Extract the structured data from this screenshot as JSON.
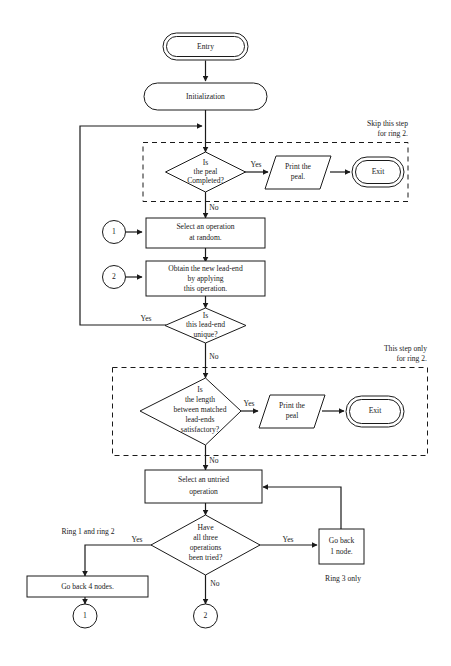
{
  "diagram": {
    "colors": {
      "stroke": "#1a1a1a",
      "background": "#ffffff"
    },
    "nodes": {
      "entry": {
        "label": "Entry",
        "type": "terminator"
      },
      "initialization": {
        "label": "Initialization",
        "type": "stadium"
      },
      "decision_peal_complete": {
        "line1": "Is",
        "line2": "the peal",
        "line3": "Completed?",
        "type": "decision"
      },
      "print_peal_1": {
        "line1": "Print the",
        "line2": "peal.",
        "type": "io"
      },
      "exit_1": {
        "label": "Exit",
        "type": "terminator"
      },
      "select_operation_random": {
        "line1": "Select an operation",
        "line2": "at random.",
        "type": "process"
      },
      "obtain_lead_end": {
        "line1": "Obtain the new lead-end",
        "line2": "by applying",
        "line3": "this operation.",
        "type": "process"
      },
      "decision_lead_end_unique": {
        "line1": "Is",
        "line2": "this lead-end",
        "line3": "unique?",
        "type": "decision"
      },
      "decision_length_satisfactory": {
        "line1": "Is",
        "line2": "the length",
        "line3": "between matched",
        "line4": "lead-ends",
        "line5": "satisfactory?",
        "type": "decision"
      },
      "print_peal_2": {
        "line1": "Print the",
        "line2": "peal",
        "type": "io"
      },
      "exit_2": {
        "label": "Exit",
        "type": "terminator"
      },
      "select_untried_operation": {
        "line1": "Select an untried",
        "line2": "operation",
        "type": "process"
      },
      "decision_all_tried": {
        "line1": "Have",
        "line2": "all three",
        "line3": "operations",
        "line4": "been tried?",
        "type": "decision"
      },
      "go_back_1_node": {
        "line1": "Go back",
        "line2": "1 node.",
        "type": "process"
      },
      "go_back_4_nodes": {
        "label": "Go back 4 nodes.",
        "type": "process"
      },
      "connector_in_1": {
        "label": "1",
        "type": "connector"
      },
      "connector_in_2": {
        "label": "2",
        "type": "connector"
      },
      "connector_out_1": {
        "label": "1",
        "type": "connector"
      },
      "connector_out_2": {
        "label": "2",
        "type": "connector"
      }
    },
    "edge_labels": {
      "peal_complete_yes": "Yes",
      "peal_complete_no": "No",
      "lead_end_unique_yes": "Yes",
      "lead_end_unique_no": "No",
      "length_satisfactory_yes": "Yes",
      "length_satisfactory_no": "No",
      "all_tried_yes_left": "Yes",
      "all_tried_yes_right": "Yes",
      "all_tried_no": "No"
    },
    "annotations": {
      "skip_step_line1": "Skip this step",
      "skip_step_line2": "for ring 2.",
      "this_step_line1": "This step only",
      "this_step_line2": "for ring 2.",
      "ring_1_and_2": "Ring 1 and ring 2",
      "ring_3_only": "Ring 3 only"
    }
  }
}
